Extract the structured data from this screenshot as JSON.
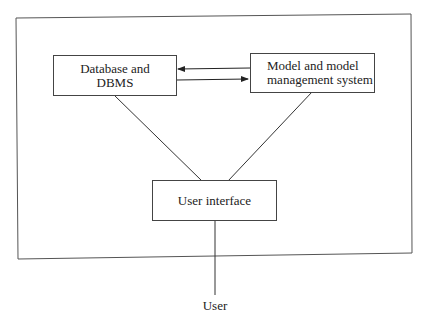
{
  "diagram": {
    "nodes": {
      "database": {
        "line1": "Database and",
        "line2": "DBMS"
      },
      "model": {
        "line1": "Model and model",
        "line2": "management system"
      },
      "ui": {
        "label": "User interface"
      },
      "user": {
        "label": "User"
      }
    },
    "edges": [
      {
        "from": "model",
        "to": "database",
        "type": "arrow"
      },
      {
        "from": "database",
        "to": "model",
        "type": "arrow"
      },
      {
        "from": "database",
        "to": "ui",
        "type": "line"
      },
      {
        "from": "model",
        "to": "ui",
        "type": "line"
      },
      {
        "from": "ui",
        "to": "user",
        "type": "line"
      }
    ],
    "colors": {
      "stroke": "#444444",
      "background": "#ffffff"
    }
  }
}
